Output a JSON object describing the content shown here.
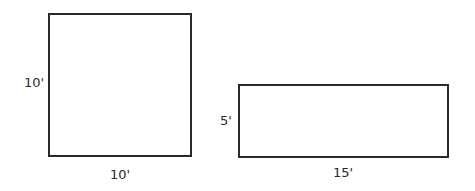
{
  "figures": [
    {
      "name": "square",
      "side_label": "10'",
      "bottom_label": "10'"
    },
    {
      "name": "rectangle",
      "side_label": "5'",
      "bottom_label": "15'"
    }
  ]
}
